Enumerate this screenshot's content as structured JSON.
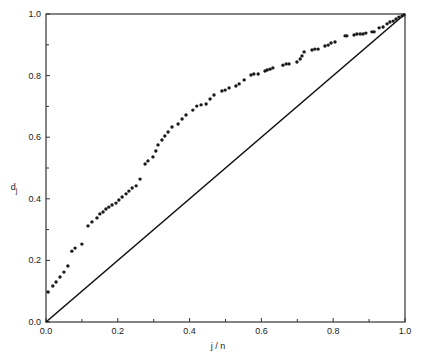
{
  "chart_data": {
    "type": "scatter",
    "title": "",
    "xlabel": "j / n",
    "ylabel": "d_j",
    "ylabel_main": "d",
    "ylabel_sub": "j",
    "xlim": [
      0.0,
      1.0
    ],
    "ylim": [
      0.0,
      1.0
    ],
    "grid": false,
    "legend": null,
    "x_ticks": [
      "0.0",
      "0.2",
      "0.4",
      "0.6",
      "0.8",
      "1.0"
    ],
    "y_ticks": [
      "0.0",
      "0.2",
      "0.4",
      "0.6",
      "0.8",
      "1.0"
    ],
    "reference_line": {
      "name": "diagonal y = x",
      "from": [
        0.0,
        0.0
      ],
      "to": [
        1.0,
        1.0
      ]
    },
    "series": [
      {
        "name": "d_j",
        "points": [
          [
            0.006,
            0.097
          ],
          [
            0.019,
            0.117
          ],
          [
            0.028,
            0.13
          ],
          [
            0.039,
            0.146
          ],
          [
            0.05,
            0.162
          ],
          [
            0.061,
            0.182
          ],
          [
            0.072,
            0.23
          ],
          [
            0.081,
            0.24
          ],
          [
            0.1,
            0.253
          ],
          [
            0.117,
            0.312
          ],
          [
            0.128,
            0.325
          ],
          [
            0.142,
            0.338
          ],
          [
            0.15,
            0.351
          ],
          [
            0.159,
            0.357
          ],
          [
            0.167,
            0.367
          ],
          [
            0.175,
            0.373
          ],
          [
            0.184,
            0.38
          ],
          [
            0.195,
            0.386
          ],
          [
            0.203,
            0.396
          ],
          [
            0.212,
            0.406
          ],
          [
            0.223,
            0.416
          ],
          [
            0.231,
            0.425
          ],
          [
            0.24,
            0.435
          ],
          [
            0.251,
            0.442
          ],
          [
            0.262,
            0.464
          ],
          [
            0.276,
            0.513
          ],
          [
            0.284,
            0.523
          ],
          [
            0.298,
            0.536
          ],
          [
            0.306,
            0.555
          ],
          [
            0.312,
            0.575
          ],
          [
            0.323,
            0.591
          ],
          [
            0.331,
            0.604
          ],
          [
            0.34,
            0.617
          ],
          [
            0.351,
            0.633
          ],
          [
            0.368,
            0.643
          ],
          [
            0.379,
            0.659
          ],
          [
            0.39,
            0.672
          ],
          [
            0.409,
            0.688
          ],
          [
            0.42,
            0.701
          ],
          [
            0.432,
            0.705
          ],
          [
            0.446,
            0.708
          ],
          [
            0.457,
            0.724
          ],
          [
            0.468,
            0.737
          ],
          [
            0.49,
            0.75
          ],
          [
            0.499,
            0.753
          ],
          [
            0.51,
            0.76
          ],
          [
            0.529,
            0.766
          ],
          [
            0.538,
            0.773
          ],
          [
            0.552,
            0.786
          ],
          [
            0.571,
            0.802
          ],
          [
            0.579,
            0.805
          ],
          [
            0.591,
            0.805
          ],
          [
            0.61,
            0.815
          ],
          [
            0.616,
            0.818
          ],
          [
            0.624,
            0.821
          ],
          [
            0.632,
            0.825
          ],
          [
            0.66,
            0.834
          ],
          [
            0.669,
            0.838
          ],
          [
            0.677,
            0.838
          ],
          [
            0.699,
            0.844
          ],
          [
            0.708,
            0.854
          ],
          [
            0.713,
            0.864
          ],
          [
            0.719,
            0.877
          ],
          [
            0.741,
            0.883
          ],
          [
            0.749,
            0.886
          ],
          [
            0.758,
            0.886
          ],
          [
            0.777,
            0.896
          ],
          [
            0.786,
            0.899
          ],
          [
            0.794,
            0.906
          ],
          [
            0.805,
            0.909
          ],
          [
            0.833,
            0.929
          ],
          [
            0.838,
            0.929
          ],
          [
            0.858,
            0.932
          ],
          [
            0.866,
            0.935
          ],
          [
            0.875,
            0.935
          ],
          [
            0.883,
            0.935
          ],
          [
            0.891,
            0.938
          ],
          [
            0.908,
            0.942
          ],
          [
            0.914,
            0.942
          ],
          [
            0.928,
            0.955
          ],
          [
            0.939,
            0.958
          ],
          [
            0.95,
            0.968
          ],
          [
            0.958,
            0.974
          ],
          [
            0.967,
            0.977
          ],
          [
            0.975,
            0.984
          ],
          [
            0.983,
            0.99
          ],
          [
            0.992,
            0.994
          ],
          [
            0.997,
            0.997
          ]
        ]
      }
    ]
  }
}
